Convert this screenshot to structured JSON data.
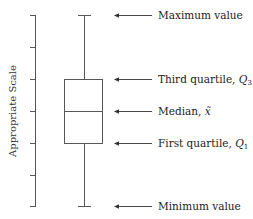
{
  "diagram": {
    "type": "box-plot-anatomy",
    "y_axis_label": "Appropriate Scale",
    "axis": {
      "x": 35,
      "top": 15,
      "bottom": 206,
      "tick_count": 7,
      "tick_ys": [
        15,
        47,
        79,
        111,
        143,
        175,
        206
      ]
    },
    "box": {
      "left": 64,
      "right": 102,
      "q3_y": 79,
      "median_y": 111,
      "q1_y": 143
    },
    "whisker": {
      "x": 84,
      "max_y": 15,
      "min_y": 206,
      "cap_half_width": 6
    },
    "annotations": [
      {
        "id": "max",
        "label": "Maximum value",
        "y": 15
      },
      {
        "id": "q3",
        "label": "Third quartile, ",
        "symbol": "Q",
        "subscript": "3",
        "y": 79
      },
      {
        "id": "median",
        "label": "Median, ",
        "symbol": "x̃",
        "subscript": "",
        "y": 111
      },
      {
        "id": "q1",
        "label": "First quartile, ",
        "symbol": "Q",
        "subscript": "1",
        "y": 143
      },
      {
        "id": "min",
        "label": "Minimum value",
        "y": 206
      }
    ],
    "colors": {
      "lines": "#555555",
      "text": "#222222",
      "background": "#ffffff"
    }
  }
}
